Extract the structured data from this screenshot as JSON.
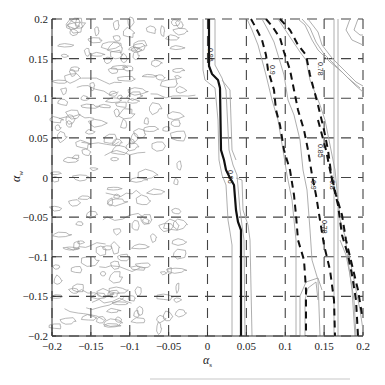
{
  "chart_data": {
    "type": "contour",
    "title": "",
    "xlabel": "α_s",
    "ylabel": "α_w",
    "xlim": [
      -0.2,
      0.2
    ],
    "ylim": [
      -0.2,
      0.2
    ],
    "grid": true,
    "grid_style": "dashed",
    "x_ticks": [
      "-0.2",
      "-0.15",
      "-0.1",
      "-0.05",
      "0",
      "0.05",
      "0.1",
      "0.15",
      "0.2"
    ],
    "y_ticks": [
      "0.2",
      "0.15",
      "0.1",
      "0.05",
      "0",
      "-0.05",
      "-0.1",
      "-0.15",
      "-0.2"
    ],
    "contour_levels": [
      {
        "label": "0.96",
        "style": "solid-bold",
        "x_at_top": 0.01,
        "x_at_bottom": 0.045
      },
      {
        "label": "0.9",
        "style": "dashed-bold",
        "x_at_top": 0.06,
        "x_at_bottom": 0.15
      },
      {
        "label": "0.85",
        "style": "dashed-bold",
        "x_at_top": 0.085,
        "x_at_bottom": 0.19
      },
      {
        "label": "0.8",
        "style": "dashed-bold",
        "x_at_top": 0.1,
        "x_at_bottom": 0.2
      },
      {
        "label": "0.78",
        "style": "dashed-bold",
        "x_at_top": 0.13,
        "x_at_bottom": 0.2
      }
    ],
    "noise_region": {
      "x_range": [
        -0.2,
        -0.03
      ],
      "description": "scattered small closed contours"
    },
    "annotations": [
      "0.96",
      "0.96",
      "0.9",
      "0.9",
      "0.85",
      "0.8",
      "0.78",
      "0.78"
    ]
  },
  "axes": {
    "xlabel": "α",
    "xlabel_sub": "s",
    "ylabel": "α",
    "ylabel_sub": "w"
  },
  "labels": {
    "c096_top": "0.96",
    "c096_mid": "0.96",
    "c09_top": "0.9",
    "c09_mid": "0.9",
    "c085": "0.85",
    "c08": "0.8",
    "c078_top": "0.78",
    "c078_mid": "0.78"
  },
  "colors": {
    "axis": "#333333",
    "grid": "#444444",
    "contour_bold": "#111111",
    "contour_light": "#9a9a9a"
  }
}
